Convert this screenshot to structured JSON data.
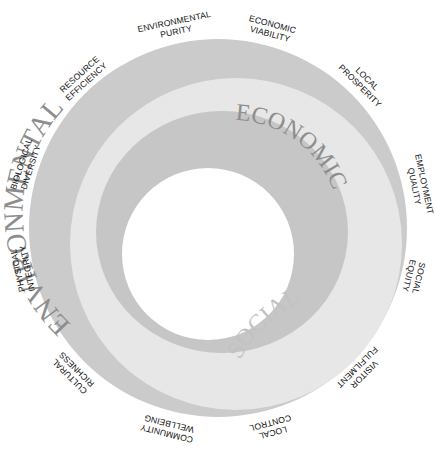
{
  "diagram": {
    "type": "concentric-rings",
    "colors": {
      "background": "#ffffff",
      "environmental_ring": "#cbcbcb",
      "social_ring": "#e7e7e7",
      "economic_ring": "#c6c6c6",
      "ring_label": "#8d8d8d",
      "outer_label": "#111111"
    },
    "rings": {
      "environmental": "ENVIRONMENTAL",
      "economic": "ECONOMIC",
      "social": "SOCIAL"
    },
    "outer_labels": [
      {
        "line1": "ENVIRONMENTAL",
        "line2": "PURITY"
      },
      {
        "line1": "ECONOMIC",
        "line2": "VIABILITY"
      },
      {
        "line1": "LOCAL",
        "line2": "PROSPERITY"
      },
      {
        "line1": "EMPLOYMENT",
        "line2": "QUALITY"
      },
      {
        "line1": "SOCIAL",
        "line2": "EQUITY"
      },
      {
        "line1": "VISITOR",
        "line2": "FULFILMENT"
      },
      {
        "line1": "LOCAL",
        "line2": "CONTROL"
      },
      {
        "line1": "COMMUNITY",
        "line2": "WELLBEING"
      },
      {
        "line1": "CULTURAL",
        "line2": "RICHNESS"
      },
      {
        "line1": "PHYSICAL",
        "line2": "INTEGRITY"
      },
      {
        "line1": "BIOLOGICAL",
        "line2": "DIVERSITY"
      },
      {
        "line1": "RESOURCE",
        "line2": "EFFICIENCY"
      }
    ]
  }
}
